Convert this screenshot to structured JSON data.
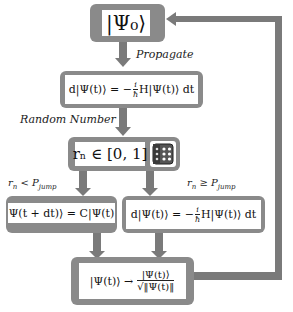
{
  "colors": {
    "box_fill": "#8a8a8a",
    "arrow_fill": "#7a7a7a",
    "inner_fill": "#ffffff",
    "background": "#ffffff"
  },
  "nodes": {
    "initial_state": {
      "text": "|Ψ₀⟩"
    },
    "propagate_eq": {
      "lhs": "d|Ψ(t)⟩ = −",
      "frac_num": "i",
      "frac_den": "ħ",
      "rhs": "H|Ψ(t)⟩ dt"
    },
    "random_number": {
      "text": "rₙ ∈ [0, 1]",
      "icon": "dice-icon"
    },
    "jump_eq": {
      "text": "Ψ(t + dt)⟩ = C|Ψ(t)"
    },
    "no_jump_eq": {
      "lhs": "d|Ψ(t)⟩ = −",
      "frac_num": "i",
      "frac_den": "ħ",
      "rhs": "H|Ψ(t)⟩ dt"
    },
    "normalize_eq": {
      "lhs": "|Ψ(t)⟩ →",
      "frac_num": "|Ψ(t)⟩",
      "frac_den": "√‖Ψ(t)‖"
    }
  },
  "edge_labels": {
    "propagate": "Propagate",
    "random_number": "Random Number",
    "jump_condition": "rₙ < P_jump",
    "no_jump_condition": "rₙ ≥ P_jump"
  },
  "jump_labels": {
    "lt_r": "r",
    "lt_n": "n",
    "lt_op": " < P",
    "lt_sub": "jump",
    "ge_r": "r",
    "ge_n": "n",
    "ge_op": " ≥ P",
    "ge_sub": "jump"
  }
}
